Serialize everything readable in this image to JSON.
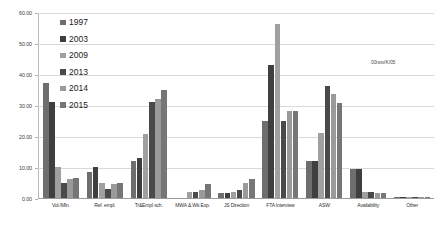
{
  "watermark": "00nov/K/05",
  "chart_data": {
    "type": "bar",
    "title": "",
    "subtitle": "",
    "xlabel": "",
    "ylabel": "",
    "ylim": [
      0,
      60
    ],
    "yticks": [
      0,
      10,
      20,
      30,
      40,
      50,
      60
    ],
    "ytick_labels": [
      "0.00",
      "10.00",
      "20.00",
      "30.00",
      "40.00",
      "50.00",
      "60.00"
    ],
    "grid": true,
    "legend_position": "top-left",
    "categories": [
      "Vol./Mln.",
      "Ref. empl.",
      "Tr&Empl sch.",
      "MWA & Wk Exp.",
      "JS Direction",
      "FTA Interview",
      "ASW",
      "Availability",
      "Other"
    ],
    "series": [
      {
        "name": "1997",
        "color": "#6e6e6e",
        "values": [
          37.0,
          8.5,
          12.0,
          0.0,
          1.5,
          25.0,
          12.0,
          9.5,
          0.4
        ]
      },
      {
        "name": "2003",
        "color": "#3f3f3f",
        "values": [
          31.0,
          10.0,
          12.8,
          0.0,
          1.5,
          43.0,
          12.0,
          9.5,
          0.4
        ]
      },
      {
        "name": "2009",
        "color": "#a0a0a0",
        "values": [
          10.0,
          5.0,
          20.5,
          2.0,
          2.0,
          56.0,
          21.0,
          2.0,
          0.3
        ]
      },
      {
        "name": "2013",
        "color": "#4a4a4a",
        "values": [
          5.0,
          3.0,
          31.0,
          2.0,
          2.5,
          25.0,
          36.0,
          2.0,
          0.3
        ]
      },
      {
        "name": "2014",
        "color": "#9a9a9a",
        "values": [
          6.0,
          4.5,
          32.0,
          2.5,
          5.0,
          28.0,
          33.5,
          1.5,
          0.3
        ]
      },
      {
        "name": "2015",
        "color": "#767676",
        "values": [
          6.5,
          5.0,
          35.0,
          4.5,
          6.0,
          28.0,
          30.5,
          1.5,
          0.3
        ]
      }
    ]
  }
}
